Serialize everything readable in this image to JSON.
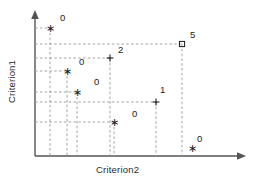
{
  "chart_data": {
    "type": "scatter",
    "title": "",
    "xlabel": "Criterion2",
    "ylabel": "Criterion1",
    "grid": false,
    "legend": null,
    "axis_style": "arrow",
    "xlim": [
      0,
      1
    ],
    "ylim": [
      0,
      1
    ],
    "guide_lines": "dashed projections from each point to both axes",
    "point_labels": [
      "0",
      "5",
      "2",
      "0",
      "0",
      "1",
      "0",
      "0"
    ],
    "markers": [
      "star",
      "square",
      "plus",
      "star",
      "star",
      "plus",
      "star",
      "star"
    ],
    "points": [
      {
        "id": "p1",
        "label": "0",
        "marker": "star",
        "px": 50,
        "py": 28,
        "label_px": 60,
        "label_py": 12,
        "guides": true
      },
      {
        "id": "p2",
        "label": "5",
        "marker": "square",
        "px": 182,
        "py": 44,
        "label_px": 190,
        "label_py": 29,
        "guides": true
      },
      {
        "id": "p3",
        "label": "2",
        "marker": "plus",
        "px": 110,
        "py": 58,
        "label_px": 118,
        "label_py": 44,
        "guides": true
      },
      {
        "id": "p4",
        "label": "0",
        "marker": "star",
        "px": 67,
        "py": 71,
        "label_px": 79,
        "label_py": 56,
        "guides": true
      },
      {
        "id": "p5",
        "label": "0",
        "marker": "star",
        "px": 77,
        "py": 92,
        "label_px": 94,
        "label_py": 76,
        "guides": true
      },
      {
        "id": "p6",
        "label": "1",
        "marker": "plus",
        "px": 156,
        "py": 102,
        "label_px": 160,
        "label_py": 84,
        "guides": true
      },
      {
        "id": "p7",
        "label": "0",
        "marker": "star",
        "px": 114,
        "py": 122,
        "label_px": 132,
        "label_py": 108,
        "guides": true
      },
      {
        "id": "p8",
        "label": "0",
        "marker": "star",
        "px": 192,
        "py": 148,
        "label_px": 197,
        "label_py": 133,
        "guides": false
      }
    ],
    "colors": {
      "axis": "#555555",
      "marker": "#1a1a1a",
      "guide": "#9a9a9a",
      "text": "#2b2b2b",
      "background": "#ffffff"
    },
    "geometry": {
      "y_axis_x": 35,
      "x_axis_y": 156,
      "y_axis_top": 12,
      "x_axis_right": 245
    }
  }
}
